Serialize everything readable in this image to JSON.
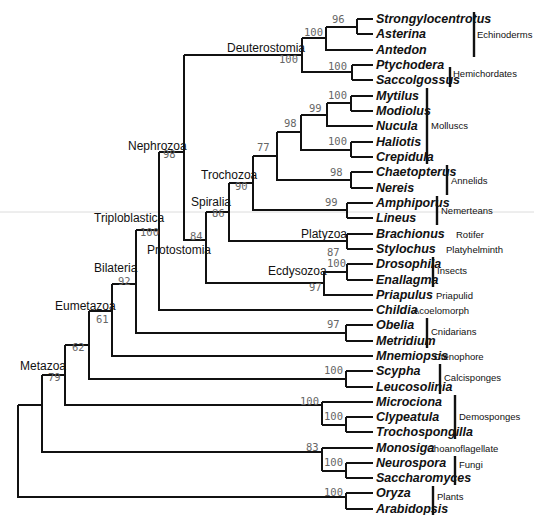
{
  "figure": {
    "type": "phylogenetic-tree",
    "leaf_tip_x": 373
  },
  "leaves": [
    {
      "name": "Strongylocentrotus",
      "y": 19,
      "parent_x": 357,
      "group": null
    },
    {
      "name": "Asterina",
      "y": 34,
      "parent_x": 357,
      "group": null
    },
    {
      "name": "Antedon",
      "y": 50,
      "parent_x": 326,
      "group": null
    },
    {
      "name": "Ptychodera",
      "y": 65,
      "parent_x": 352,
      "group": null
    },
    {
      "name": "Saccolgossus",
      "y": 80,
      "parent_x": 352,
      "group": null
    },
    {
      "name": "Mytilus",
      "y": 96,
      "parent_x": 351,
      "group": null
    },
    {
      "name": "Modiolus",
      "y": 111,
      "parent_x": 351,
      "group": null
    },
    {
      "name": "Nucula",
      "y": 126,
      "parent_x": 327,
      "group": null
    },
    {
      "name": "Haliotis",
      "y": 142,
      "parent_x": 351,
      "group": null
    },
    {
      "name": "Crepidula",
      "y": 157,
      "parent_x": 351,
      "group": null
    },
    {
      "name": "Chaetopterus",
      "y": 172,
      "parent_x": 351,
      "group": null
    },
    {
      "name": "Nereis",
      "y": 188,
      "parent_x": 351,
      "group": null
    },
    {
      "name": "Amphiporus",
      "y": 203,
      "parent_x": 347,
      "group": null
    },
    {
      "name": "Lineus",
      "y": 218,
      "parent_x": 347,
      "group": null
    },
    {
      "name": "Brachionus",
      "y": 234,
      "parent_x": 347,
      "group": "Rotifer"
    },
    {
      "name": "Stylochus",
      "y": 249,
      "parent_x": 347,
      "group": "Platyhelminth"
    },
    {
      "name": "Drosophila",
      "y": 264,
      "parent_x": 347,
      "group": null
    },
    {
      "name": "Enallagma",
      "y": 280,
      "parent_x": 347,
      "group": null
    },
    {
      "name": "Priapulus",
      "y": 295,
      "parent_x": 324,
      "group": "Priapulid"
    },
    {
      "name": "Childia",
      "y": 310,
      "parent_x": 159,
      "group": "Acoelomorph"
    },
    {
      "name": "Obelia",
      "y": 325,
      "parent_x": 346,
      "group": null
    },
    {
      "name": "Metridium",
      "y": 341,
      "parent_x": 346,
      "group": null
    },
    {
      "name": "Mnemiopsis",
      "y": 356,
      "parent_x": 87,
      "group": "Ctenophore"
    },
    {
      "name": "Scypha",
      "y": 371,
      "parent_x": 346,
      "group": null
    },
    {
      "name": "Leucosolinia",
      "y": 387,
      "parent_x": 346,
      "group": null
    },
    {
      "name": "Microciona",
      "y": 402,
      "parent_x": 322,
      "group": null
    },
    {
      "name": "Clypeatula",
      "y": 417,
      "parent_x": 346,
      "group": null
    },
    {
      "name": "Trochospongilla",
      "y": 432,
      "parent_x": 346,
      "group": null
    },
    {
      "name": "Monosiga",
      "y": 448,
      "parent_x": 322,
      "group": "Choanoflagellate"
    },
    {
      "name": "Neurospora",
      "y": 463,
      "parent_x": 346,
      "group": null
    },
    {
      "name": "Saccharomyces",
      "y": 478,
      "parent_x": 346,
      "group": null
    },
    {
      "name": "Oryza",
      "y": 493,
      "parent_x": 346,
      "group": null
    },
    {
      "name": "Arabidopsis",
      "y": 509,
      "parent_x": 346,
      "group": null
    }
  ],
  "groups": [
    {
      "label": "Echinoderms",
      "y1": 12,
      "y2": 57
    },
    {
      "label": "Hemichordates",
      "y1": 67,
      "y2": 87
    },
    {
      "label": "Molluscs",
      "y1": 88,
      "y2": 164
    },
    {
      "label": "Annelids",
      "y1": 165,
      "y2": 195
    },
    {
      "label": "Nemerteans",
      "y1": 196,
      "y2": 225
    },
    {
      "label": "Insects",
      "y1": 257,
      "y2": 287
    },
    {
      "label": "Cnidarians",
      "y1": 318,
      "y2": 348
    },
    {
      "label": "Calcisponges",
      "y1": 364,
      "y2": 394
    },
    {
      "label": "Demosponges",
      "y1": 395,
      "y2": 439
    },
    {
      "label": "Fungi",
      "y1": 456,
      "y2": 485
    },
    {
      "label": "Plants",
      "y1": 486,
      "y2": 515
    }
  ],
  "clades": [
    {
      "name": "Deuterostomia",
      "bootstrap": "100"
    },
    {
      "name": "Nephrozoa",
      "bootstrap": "98"
    },
    {
      "name": "Triploblastica",
      "bootstrap": "100"
    },
    {
      "name": "Protostomia",
      "bootstrap": "84"
    },
    {
      "name": "Spiralia",
      "bootstrap": "86"
    },
    {
      "name": "Trochozoa",
      "bootstrap": "90"
    },
    {
      "name": "Platyzoa",
      "bootstrap": "87"
    },
    {
      "name": "Ecdysozoa",
      "bootstrap": "97"
    },
    {
      "name": "Bilateria",
      "bootstrap": "92"
    },
    {
      "name": "Eumetazoa",
      "bootstrap": "61"
    },
    {
      "name": "Metazoa",
      "bootstrap": "79"
    }
  ],
  "unnamed_nodes_bootstrap": {
    "echinoderms_strongy_asterina": "96",
    "echinoderms": "100",
    "hemichordates": "100",
    "mytilus_modiolus": "100",
    "mytilus_modiolus_nucula": "99",
    "haliotis_crepidula": "100",
    "molluscs": "98",
    "molluscs_annelids": "77",
    "annelids": "98",
    "nemerteans": "99",
    "insects": "100",
    "cnidarians": "97",
    "calcisponges": "100",
    "demosponges": "100",
    "clypeatula_trochospongilla": "100",
    "opisthokont_outgroup": "83",
    "fungi": "100",
    "plants": "100",
    "eumetazoa_plus_calcisponges": "62"
  }
}
